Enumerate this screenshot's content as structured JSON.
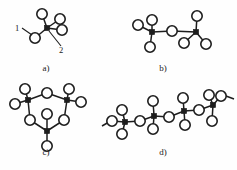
{
  "figure": {
    "background_color": "#fefefe",
    "ink_color": "#1d1d1d",
    "node_fill_oxygen": "#ffffff",
    "node_fill_center": "#1d1d1d",
    "width": 237,
    "height": 170
  },
  "panels": [
    {
      "id": "a",
      "label": "a)",
      "label_x": 46,
      "label_y": 71,
      "description": "isolated tetrahedron",
      "centers": [
        {
          "name": "center-atom",
          "x": 47,
          "y": 28
        }
      ],
      "oxygens": [
        {
          "name": "oxygen-top",
          "x": 42,
          "y": 14
        },
        {
          "name": "oxygen-upper-right",
          "x": 60,
          "y": 19
        },
        {
          "name": "oxygen-right",
          "x": 62,
          "y": 30
        },
        {
          "name": "oxygen-lower-left",
          "x": 35,
          "y": 38
        }
      ],
      "bonds": [
        {
          "from": "center-atom",
          "to": "oxygen-top"
        },
        {
          "from": "center-atom",
          "to": "oxygen-upper-right"
        },
        {
          "from": "center-atom",
          "to": "oxygen-right"
        },
        {
          "from": "center-atom",
          "to": "oxygen-lower-left"
        }
      ],
      "callouts": [
        {
          "name": "bond-label-1",
          "text": "1",
          "text_x": 17,
          "text_y": 31,
          "leader": {
            "x1": 22,
            "y1": 28,
            "x2": 32,
            "y2": 35
          }
        },
        {
          "name": "bond-label-2",
          "text": "2",
          "text_x": 61,
          "text_y": 53,
          "leader": {
            "x1": 49,
            "y1": 31,
            "x2": 61,
            "y2": 46
          }
        }
      ]
    },
    {
      "id": "b",
      "label": "b)",
      "label_x": 163,
      "label_y": 71,
      "description": "corner-sharing dimer of two tetrahedra",
      "centers": [
        {
          "name": "center-atom-left",
          "x": 152,
          "y": 32
        },
        {
          "name": "center-atom-right",
          "x": 196,
          "y": 32
        }
      ],
      "oxygens": [
        {
          "name": "oxygen-left-outer",
          "x": 138,
          "y": 25
        },
        {
          "name": "oxygen-left-top",
          "x": 152,
          "y": 20
        },
        {
          "name": "oxygen-left-bottom",
          "x": 150,
          "y": 47
        },
        {
          "name": "oxygen-bridging",
          "x": 172,
          "y": 31
        },
        {
          "name": "oxygen-right-top",
          "x": 197,
          "y": 16
        },
        {
          "name": "oxygen-right-lower-left",
          "x": 184,
          "y": 43
        },
        {
          "name": "oxygen-right-lower-right",
          "x": 206,
          "y": 44
        }
      ],
      "bonds": [
        {
          "from": "center-atom-left",
          "to": "oxygen-left-outer"
        },
        {
          "from": "center-atom-left",
          "to": "oxygen-left-top"
        },
        {
          "from": "center-atom-left",
          "to": "oxygen-left-bottom"
        },
        {
          "from": "center-atom-left",
          "to": "oxygen-bridging"
        },
        {
          "from": "oxygen-bridging",
          "to": "center-atom-right"
        },
        {
          "from": "center-atom-right",
          "to": "oxygen-right-top"
        },
        {
          "from": "center-atom-right",
          "to": "oxygen-right-lower-left"
        },
        {
          "from": "center-atom-right",
          "to": "oxygen-right-lower-right"
        }
      ],
      "callouts": []
    },
    {
      "id": "c",
      "label": "c)",
      "label_x": 46,
      "label_y": 155,
      "description": "cyclic trimer ring of three tetrahedra",
      "centers": [
        {
          "name": "center-atom-left",
          "x": 28,
          "y": 100
        },
        {
          "name": "center-atom-right",
          "x": 67,
          "y": 100
        },
        {
          "name": "center-atom-bottom",
          "x": 47,
          "y": 131
        }
      ],
      "oxygens": [
        {
          "name": "oxygen-left-top",
          "x": 25,
          "y": 89
        },
        {
          "name": "oxygen-left-outer",
          "x": 15,
          "y": 104
        },
        {
          "name": "oxygen-ring-top",
          "x": 47,
          "y": 93
        },
        {
          "name": "oxygen-right-top",
          "x": 69,
          "y": 89
        },
        {
          "name": "oxygen-right-outer",
          "x": 81,
          "y": 102
        },
        {
          "name": "oxygen-ring-left",
          "x": 30,
          "y": 120
        },
        {
          "name": "oxygen-ring-right",
          "x": 64,
          "y": 120
        },
        {
          "name": "oxygen-center-inner",
          "x": 47,
          "y": 114
        },
        {
          "name": "oxygen-bottom-outer",
          "x": 47,
          "y": 146
        }
      ],
      "bonds": [
        {
          "from": "center-atom-left",
          "to": "oxygen-left-top"
        },
        {
          "from": "center-atom-left",
          "to": "oxygen-left-outer"
        },
        {
          "from": "center-atom-left",
          "to": "oxygen-ring-top"
        },
        {
          "from": "oxygen-ring-top",
          "to": "center-atom-right"
        },
        {
          "from": "center-atom-right",
          "to": "oxygen-right-top"
        },
        {
          "from": "center-atom-right",
          "to": "oxygen-right-outer"
        },
        {
          "from": "center-atom-right",
          "to": "oxygen-ring-right"
        },
        {
          "from": "oxygen-ring-right",
          "to": "center-atom-bottom"
        },
        {
          "from": "center-atom-bottom",
          "to": "oxygen-ring-left"
        },
        {
          "from": "oxygen-ring-left",
          "to": "center-atom-left"
        },
        {
          "from": "center-atom-bottom",
          "to": "oxygen-center-inner"
        },
        {
          "from": "center-atom-bottom",
          "to": "oxygen-bottom-outer"
        }
      ],
      "callouts": []
    },
    {
      "id": "d",
      "label": "d)",
      "label_x": 163,
      "label_y": 155,
      "description": "infinite chain of corner-sharing tetrahedra",
      "centers": [
        {
          "name": "center-atom-1",
          "x": 125,
          "y": 122
        },
        {
          "name": "center-atom-2",
          "x": 154,
          "y": 116
        },
        {
          "name": "center-atom-3",
          "x": 184,
          "y": 111
        },
        {
          "name": "center-atom-4",
          "x": 213,
          "y": 105
        }
      ],
      "oxygens": [
        {
          "name": "oxygen-1-top",
          "x": 122,
          "y": 110
        },
        {
          "name": "oxygen-1-left",
          "x": 112,
          "y": 121
        },
        {
          "name": "oxygen-1-bottom",
          "x": 122,
          "y": 134
        },
        {
          "name": "oxygen-bridge-12",
          "x": 140,
          "y": 121
        },
        {
          "name": "oxygen-2-top",
          "x": 153,
          "y": 101
        },
        {
          "name": "oxygen-2-bottom",
          "x": 153,
          "y": 129
        },
        {
          "name": "oxygen-bridge-23",
          "x": 169,
          "y": 117
        },
        {
          "name": "oxygen-3-top",
          "x": 183,
          "y": 98
        },
        {
          "name": "oxygen-3-bottom",
          "x": 185,
          "y": 125
        },
        {
          "name": "oxygen-bridge-34",
          "x": 199,
          "y": 110
        },
        {
          "name": "oxygen-4-top",
          "x": 209,
          "y": 95
        },
        {
          "name": "oxygen-4-upper-right",
          "x": 221,
          "y": 96
        },
        {
          "name": "oxygen-4-bottom",
          "x": 212,
          "y": 121
        }
      ],
      "bonds": [
        {
          "from": "center-atom-1",
          "to": "oxygen-1-top"
        },
        {
          "from": "center-atom-1",
          "to": "oxygen-1-left"
        },
        {
          "from": "center-atom-1",
          "to": "oxygen-1-bottom"
        },
        {
          "from": "center-atom-1",
          "to": "oxygen-bridge-12"
        },
        {
          "from": "oxygen-bridge-12",
          "to": "center-atom-2"
        },
        {
          "from": "center-atom-2",
          "to": "oxygen-2-top"
        },
        {
          "from": "center-atom-2",
          "to": "oxygen-2-bottom"
        },
        {
          "from": "center-atom-2",
          "to": "oxygen-bridge-23"
        },
        {
          "from": "oxygen-bridge-23",
          "to": "center-atom-3"
        },
        {
          "from": "center-atom-3",
          "to": "oxygen-3-top"
        },
        {
          "from": "center-atom-3",
          "to": "oxygen-3-bottom"
        },
        {
          "from": "center-atom-3",
          "to": "oxygen-bridge-34"
        },
        {
          "from": "oxygen-bridge-34",
          "to": "center-atom-4"
        },
        {
          "from": "center-atom-4",
          "to": "oxygen-4-top"
        },
        {
          "from": "center-atom-4",
          "to": "oxygen-4-upper-right"
        },
        {
          "from": "center-atom-4",
          "to": "oxygen-4-bottom"
        }
      ],
      "chain_extensions": [
        {
          "name": "chain-tail-left",
          "x1": 102,
          "y1": 126,
          "x2": 109,
          "y2": 122
        },
        {
          "name": "chain-tail-right",
          "x1": 226,
          "y1": 96,
          "x2": 234,
          "y2": 99
        }
      ],
      "callouts": []
    }
  ],
  "geometry": {
    "oxygen_radius": 5.2,
    "center_half_size": 2.6
  }
}
